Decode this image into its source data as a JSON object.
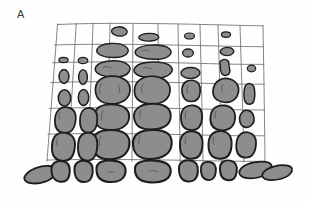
{
  "figure": {
    "panel_label": "A",
    "background_color": "#fefefe"
  },
  "palette": {
    "stone_fill": "#8d8d8d",
    "stone_fill_dark": "#7a7a7a",
    "stone_fill_small": "#848484",
    "stone_outline": "#1d1d1d",
    "grid_line": "#6e6e6e",
    "texture_mark": "#4a4a4a",
    "label_color": "#3b3b3b",
    "joint_color": "#ffffff"
  },
  "grid": {
    "description": "hand-drawn irregular quadrilateral mesh overlaying the wall",
    "visible": true,
    "column_count": 10,
    "row_count": 6,
    "stroke_width": 0.85,
    "vertical_lines_top_x": [
      57,
      76,
      93,
      110,
      133,
      158,
      178,
      200,
      218,
      240,
      263
    ],
    "vertical_lines_bottom_x": [
      47,
      68,
      88,
      107,
      132,
      159,
      180,
      203,
      222,
      244,
      265
    ],
    "horizontal_rows_y": [
      24,
      45,
      62,
      82,
      108,
      134,
      160
    ],
    "top_edge_y": 24,
    "bottom_edge_y": 160,
    "left_edge_x_top": 57,
    "left_edge_x_bottom": 47,
    "right_edge_x_top": 263,
    "right_edge_x_bottom": 265
  },
  "wall": {
    "description": "stones graded by size: smallest pebbles at top, largest blocks at the base",
    "left_extent_px": 25,
    "right_extent_px": 292,
    "top_extent_px": 24,
    "base_row_y": 160,
    "base_row_bottom_y": 188,
    "size_gradient": "increasing downward"
  },
  "stone_rows": [
    {
      "row_index": 0,
      "name": "row-top-pebbles",
      "y_center": 35,
      "size_class": "very-small",
      "stone_count": 6
    },
    {
      "row_index": 1,
      "name": "row-small-cobbles",
      "y_center": 54,
      "size_class": "small",
      "stone_count": 9
    },
    {
      "row_index": 2,
      "name": "row-flat-slabs",
      "y_center": 72,
      "size_class": "small-medium",
      "stone_count": 9
    },
    {
      "row_index": 3,
      "name": "row-medium-blocks",
      "y_center": 95,
      "size_class": "medium",
      "stone_count": 8
    },
    {
      "row_index": 4,
      "name": "row-large-blocks",
      "y_center": 121,
      "size_class": "large",
      "stone_count": 8
    },
    {
      "row_index": 5,
      "name": "row-basal-blocks",
      "y_center": 147,
      "size_class": "largest",
      "stone_count": 8
    },
    {
      "row_index": 6,
      "name": "row-foundation",
      "y_center": 174,
      "size_class": "foundation-course",
      "stone_count": 10
    }
  ]
}
